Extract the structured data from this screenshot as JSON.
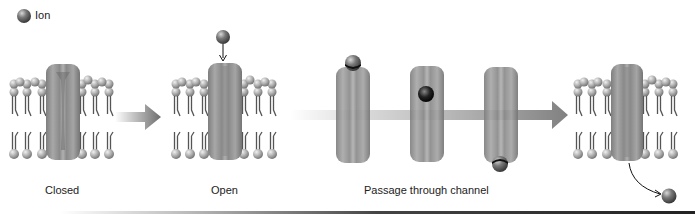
{
  "legend": {
    "ion_label": "Ion"
  },
  "stages": [
    {
      "id": "closed",
      "label": "Closed"
    },
    {
      "id": "open",
      "label": "Open"
    },
    {
      "id": "passage",
      "label": "Passage through channel"
    }
  ],
  "colors": {
    "background": "#ffffff",
    "channel": "#9a9a9a",
    "channel_dark": "#6f6f6f",
    "ion": "#6a6a6a",
    "lipid_head": "#b5b5b5",
    "lipid_tail": "#555555",
    "arrow": "#8a8a8a"
  }
}
